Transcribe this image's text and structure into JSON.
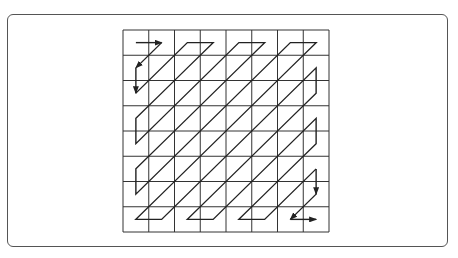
{
  "diagram": {
    "type": "zigzag-scan",
    "grid": {
      "rows": 8,
      "cols": 8,
      "x": 123,
      "y": 30,
      "width": 206,
      "height": 202
    },
    "line_color": "#222222",
    "grid_color": "#333333",
    "frame_color": "#555555"
  }
}
